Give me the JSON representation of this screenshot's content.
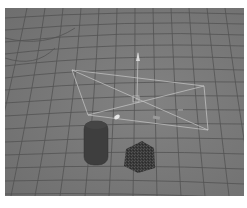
{
  "viewport": {
    "label": "3D perspective viewport",
    "background_color": "#7a7a7a",
    "grid_color": "#4a4a4a",
    "gizmo_color": "#c8c8c8"
  },
  "scene": {
    "objects": [
      {
        "name": "cylinder",
        "color": "#3e3e3e"
      },
      {
        "name": "fuzzy-cube",
        "color": "#3a3a3a"
      },
      {
        "name": "area-light-emitter",
        "color": "#c8c8c8"
      }
    ]
  }
}
